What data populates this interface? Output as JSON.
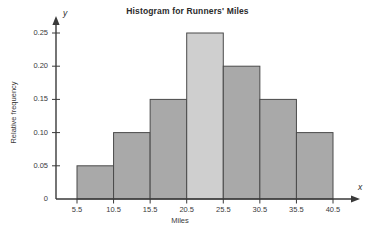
{
  "chart_data": {
    "type": "bar",
    "title": "Histogram for Runners' Miles",
    "xlabel": "Miles",
    "ylabel": "Relative frequency",
    "x_axis_variable": "x",
    "y_axis_variable": "y",
    "categories": [
      "5.5-10.5",
      "10.5-15.5",
      "15.5-20.5",
      "20.5-25.5",
      "25.5-30.5",
      "30.5-35.5",
      "35.5-40.5"
    ],
    "bin_edges": [
      5.5,
      10.5,
      15.5,
      20.5,
      25.5,
      30.5,
      35.5,
      40.5
    ],
    "values": [
      0.05,
      0.1,
      0.15,
      0.25,
      0.2,
      0.15,
      0.1
    ],
    "xtick_labels": [
      "5.5",
      "10.5",
      "15.5",
      "20.5",
      "25.5",
      "30.5",
      "35.5",
      "40.5"
    ],
    "xticks": [
      5.5,
      10.5,
      15.5,
      20.5,
      25.5,
      30.5,
      35.5,
      40.5
    ],
    "ytick_labels": [
      "0",
      "0.05",
      "0.10",
      "0.15",
      "0.20",
      "0.25"
    ],
    "yticks": [
      0,
      0.05,
      0.1,
      0.15,
      0.2,
      0.25
    ],
    "ylim": [
      0,
      0.27
    ],
    "xlim": [
      0,
      45.5
    ],
    "grid": false,
    "legend": "none",
    "bar_fill": "#a9a9a9",
    "bar_fill_highlight": "#cfcfcf",
    "bar_stroke": "#4a4a4a",
    "highlight_index": 3,
    "axis_color": "#3a3a3a",
    "background": "#ffffff"
  }
}
